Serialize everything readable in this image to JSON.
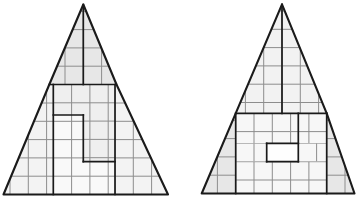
{
  "figure": {
    "canvas": {
      "width": 358,
      "height": 201,
      "background": "#ffffff"
    },
    "style": {
      "darkLineColor": "#1a1a1a",
      "gridLineColor": "#8d8d8d",
      "outerLineWidth": 2.1,
      "innerLineWidth": 1.7,
      "gridLineWidth": 1,
      "gridSpacing": 18.3
    },
    "triangles": [
      {
        "id": "left-triangle",
        "outline": [
          [
            83.3,
            4.5
          ],
          [
            116.5,
            84.5
          ],
          [
            168,
            194.5
          ],
          [
            3.5,
            194.5
          ],
          [
            49.3,
            84.5
          ]
        ],
        "regions": [
          {
            "name": "top-triangle-piece",
            "fill": "#e7e7e7",
            "gridOrigin": [
              83.3,
              84.5
            ],
            "points": [
              [
                83.3,
                4.5
              ],
              [
                116.5,
                84.5
              ],
              [
                49.3,
                84.5
              ]
            ]
          },
          {
            "name": "left-sliver-piece",
            "fill": "#f3f3f3",
            "gridOrigin": [
              10,
              194.5
            ],
            "points": [
              [
                49.3,
                84.5
              ],
              [
                53.3,
                84.5
              ],
              [
                53.3,
                194.5
              ],
              [
                3.5,
                194.5
              ]
            ]
          },
          {
            "name": "right-sliver-piece",
            "fill": "#f3f3f3",
            "gridOrigin": [
              133.3,
              194.5
            ],
            "points": [
              [
                116.5,
                84.5
              ],
              [
                168,
                194.5
              ],
              [
                115,
                194.5
              ],
              [
                115,
                84.5
              ]
            ]
          },
          {
            "name": "upper-step-piece",
            "fill": "#efefef",
            "gridOrigin": [
              53.3,
              84.5
            ],
            "points": [
              [
                53.3,
                84.5
              ],
              [
                115,
                84.5
              ],
              [
                115,
                161.7
              ],
              [
                83.3,
                161.7
              ],
              [
                83.3,
                115
              ],
              [
                53.3,
                115
              ]
            ]
          },
          {
            "name": "lower-step-piece",
            "fill": "#f9f9f9",
            "gridOrigin": [
              53.3,
              194.5
            ],
            "points": [
              [
                53.3,
                115
              ],
              [
                83.3,
                115
              ],
              [
                83.3,
                161.7
              ],
              [
                115,
                161.7
              ],
              [
                115,
                194.5
              ],
              [
                53.3,
                194.5
              ]
            ]
          }
        ],
        "innerLines": [
          [
            [
              49.3,
              84.5
            ],
            [
              116.5,
              84.5
            ]
          ],
          [
            [
              83.3,
              4.5
            ],
            [
              83.3,
              84.5
            ]
          ],
          [
            [
              53.3,
              84.5
            ],
            [
              53.3,
              194.5
            ]
          ],
          [
            [
              115,
              84.5
            ],
            [
              115,
              194.5
            ]
          ],
          [
            [
              53.3,
              115
            ],
            [
              83.3,
              115
            ]
          ],
          [
            [
              83.3,
              115
            ],
            [
              83.3,
              161.7
            ]
          ],
          [
            [
              83.3,
              161.7
            ],
            [
              115,
              161.7
            ]
          ]
        ]
      },
      {
        "id": "right-triangle",
        "outline": [
          [
            282,
            4.3
          ],
          [
            326.7,
            113.3
          ],
          [
            354.5,
            193.5
          ],
          [
            201.7,
            193.5
          ],
          [
            235.7,
            113.3
          ]
        ],
        "regions": [
          {
            "name": "top-triangle-piece",
            "fill": "#f2f2f2",
            "gridOrigin": [
              282,
              29.3
            ],
            "points": [
              [
                282,
                4.3
              ],
              [
                326.7,
                113.3
              ],
              [
                235.7,
                113.3
              ]
            ]
          },
          {
            "name": "left-sliver-piece",
            "fill": "#e7e7e7",
            "gridOrigin": [
              217.4,
              193.5
            ],
            "points": [
              [
                235.7,
                113.3
              ],
              [
                235.7,
                193.5
              ],
              [
                201.7,
                193.5
              ]
            ]
          },
          {
            "name": "right-sliver-piece",
            "fill": "#e7e7e7",
            "gridOrigin": [
              345,
              193.5
            ],
            "points": [
              [
                326.7,
                113.3
              ],
              [
                354.5,
                193.5
              ],
              [
                326.7,
                193.5
              ]
            ]
          },
          {
            "name": "middle-upper-band",
            "fill": "#f7f7f7",
            "gridOrigin": [
              235.7,
              113.3
            ],
            "points": [
              [
                235.7,
                113.3
              ],
              [
                326.7,
                113.3
              ],
              [
                326.7,
                143.3
              ],
              [
                235.7,
                143.3
              ]
            ]
          },
          {
            "name": "middle-left-block",
            "fill": "#f7f7f7",
            "gridOrigin": [
              235.7,
              143.3
            ],
            "points": [
              [
                235.7,
                143.3
              ],
              [
                266.7,
                143.3
              ],
              [
                266.7,
                161.7
              ],
              [
                235.7,
                161.7
              ]
            ]
          },
          {
            "name": "hole-rectangle",
            "fill": "#fefefe",
            "gridOrigin": null,
            "points": [
              [
                266.7,
                143.3
              ],
              [
                298.3,
                143.3
              ],
              [
                298.3,
                161.7
              ],
              [
                266.7,
                161.7
              ]
            ]
          },
          {
            "name": "middle-right-block",
            "fill": "#f7f7f7",
            "gridOrigin": [
              298.3,
              143.3
            ],
            "points": [
              [
                298.3,
                143.3
              ],
              [
                326.7,
                143.3
              ],
              [
                326.7,
                161.7
              ],
              [
                298.3,
                161.7
              ]
            ]
          },
          {
            "name": "middle-lower-band",
            "fill": "#f7f7f7",
            "gridOrigin": [
              235.7,
              161.7
            ],
            "points": [
              [
                235.7,
                161.7
              ],
              [
                326.7,
                161.7
              ],
              [
                326.7,
                193.5
              ],
              [
                235.7,
                193.5
              ]
            ]
          }
        ],
        "innerLines": [
          [
            [
              235.7,
              113.3
            ],
            [
              326.7,
              113.3
            ]
          ],
          [
            [
              282,
              4.3
            ],
            [
              282,
              113.3
            ]
          ],
          [
            [
              235.7,
              113.3
            ],
            [
              235.7,
              193.5
            ]
          ],
          [
            [
              326.7,
              113.3
            ],
            [
              326.7,
              193.5
            ]
          ],
          [
            [
              298.3,
              113.3
            ],
            [
              298.3,
              161.7
            ]
          ],
          [
            [
              266.7,
              143.3
            ],
            [
              298.3,
              143.3
            ]
          ],
          [
            [
              266.7,
              143.3
            ],
            [
              266.7,
              161.7
            ]
          ],
          [
            [
              266.7,
              161.7
            ],
            [
              298.3,
              161.7
            ]
          ]
        ]
      }
    ]
  }
}
